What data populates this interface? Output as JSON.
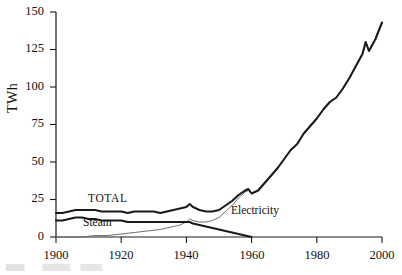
{
  "chart_data": {
    "type": "line",
    "title": "",
    "xlabel": "",
    "ylabel": "TWh",
    "xlim": [
      1900,
      2000
    ],
    "ylim": [
      0,
      150
    ],
    "grid": false,
    "legend_position": "inline-annotations",
    "xticks": [
      "1900",
      "1920",
      "1940",
      "1960",
      "1980",
      "2000"
    ],
    "yticks": [
      "0",
      "25",
      "50",
      "75",
      "100",
      "125",
      "150"
    ],
    "annotations": [
      {
        "text": "TOTAL",
        "x": 1910,
        "y": 22
      },
      {
        "text": "Steam",
        "x": 1908,
        "y": 6
      },
      {
        "text": "Electricity",
        "x": 1954,
        "y": 13
      }
    ],
    "series": [
      {
        "name": "TOTAL",
        "style": "thick-solid-black",
        "color": "#1a1a1a",
        "x": [
          1900,
          1902,
          1904,
          1906,
          1908,
          1910,
          1912,
          1914,
          1916,
          1918,
          1920,
          1922,
          1924,
          1926,
          1928,
          1930,
          1932,
          1934,
          1936,
          1938,
          1940,
          1941,
          1942,
          1944,
          1946,
          1948,
          1950,
          1952,
          1954,
          1956,
          1958,
          1959,
          1960,
          1962,
          1964,
          1966,
          1968,
          1970,
          1972,
          1974,
          1976,
          1978,
          1980,
          1982,
          1984,
          1986,
          1988,
          1990,
          1992,
          1994,
          1995,
          1996,
          1998,
          2000
        ],
        "values": [
          16,
          16,
          17,
          18,
          18,
          18,
          18,
          17,
          17,
          17,
          17,
          16,
          17,
          17,
          17,
          17,
          16,
          17,
          18,
          19,
          20,
          22,
          20,
          18,
          17,
          17,
          18,
          21,
          24,
          28,
          31,
          32,
          29,
          31,
          36,
          41,
          46,
          52,
          58,
          62,
          69,
          74,
          79,
          85,
          90,
          93,
          99,
          106,
          114,
          122,
          130,
          124,
          132,
          143
        ]
      },
      {
        "name": "Steam",
        "style": "thick-solid-black",
        "color": "#1a1a1a",
        "x": [
          1900,
          1902,
          1904,
          1906,
          1908,
          1910,
          1912,
          1914,
          1916,
          1918,
          1920,
          1922,
          1924,
          1926,
          1928,
          1930,
          1932,
          1934,
          1936,
          1938,
          1940,
          1941,
          1942,
          1944,
          1946,
          1948,
          1950,
          1952,
          1954,
          1956,
          1958,
          1960
        ],
        "values": [
          11,
          11,
          12,
          13,
          13,
          12,
          12,
          11,
          11,
          11,
          11,
          10,
          10,
          10,
          10,
          10,
          10,
          10,
          10,
          10,
          10,
          10,
          9,
          8,
          7,
          6,
          5,
          4,
          3,
          2,
          1,
          0
        ]
      },
      {
        "name": "Electricity",
        "style": "thin-solid-gray",
        "color": "#6f6f6f",
        "x": [
          1900,
          1904,
          1908,
          1912,
          1916,
          1920,
          1924,
          1928,
          1932,
          1934,
          1936,
          1938,
          1940,
          1941,
          1942,
          1944,
          1946,
          1948,
          1950,
          1952,
          1954,
          1956,
          1958,
          1959,
          1960,
          1962,
          1964,
          1966,
          1968,
          1970,
          1972,
          1974,
          1976,
          1978,
          1980,
          1982,
          1984,
          1986,
          1988,
          1990,
          1992,
          1994,
          1995,
          1996,
          1998,
          2000
        ],
        "values": [
          0,
          0,
          0,
          1,
          1,
          2,
          3,
          4,
          5,
          6,
          7,
          8,
          10,
          12,
          11,
          10,
          10,
          11,
          13,
          17,
          21,
          26,
          30,
          31,
          29,
          31,
          36,
          41,
          46,
          52,
          58,
          62,
          69,
          74,
          79,
          85,
          90,
          93,
          99,
          106,
          114,
          122,
          130,
          124,
          132,
          143
        ]
      }
    ]
  },
  "axis": {
    "y_title": "TWh"
  },
  "labels": {
    "total": "TOTAL",
    "steam": "Steam",
    "electricity": "Electricity"
  },
  "ticks": {
    "y": [
      "150",
      "125",
      "100",
      "75",
      "50",
      "25",
      "0"
    ],
    "x": [
      "1900",
      "1920",
      "1940",
      "1960",
      "1980",
      "2000"
    ]
  }
}
